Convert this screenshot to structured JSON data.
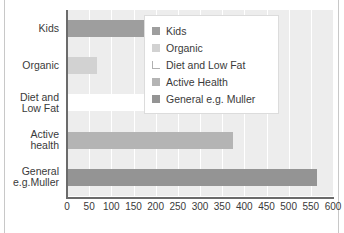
{
  "chart_data": {
    "type": "bar",
    "orientation": "horizontal",
    "title": "",
    "xlabel": "",
    "ylabel": "",
    "categories": [
      "Kids",
      "Organic",
      "Diet and Low Fat",
      "Active health",
      "General e.g.Muller"
    ],
    "category_labels_lines": [
      [
        "Kids"
      ],
      [
        "Organic"
      ],
      [
        "Diet and",
        "Low Fat"
      ],
      [
        "Active",
        "health"
      ],
      [
        "General",
        "e.g.Muller"
      ]
    ],
    "values": [
      190,
      68,
      240,
      375,
      565
    ],
    "xlim": [
      0,
      600
    ],
    "xticks": [
      0,
      50,
      100,
      150,
      200,
      250,
      300,
      350,
      400,
      450,
      500,
      550,
      600
    ],
    "xtick_labels": [
      "0",
      "50",
      "100",
      "150",
      "200",
      "250",
      "300",
      "350",
      "400",
      "450",
      "500",
      "550",
      "600"
    ],
    "grid": "vertical",
    "legend_position": "top-right",
    "series_colors": [
      "#9e9e9e",
      "#d2d2d2",
      "#ffffff",
      "#b4b4b4",
      "#949494"
    ],
    "legend": [
      {
        "label": "Kids",
        "color": "#9e9e9e"
      },
      {
        "label": "Organic",
        "color": "#d2d2d2"
      },
      {
        "label": "Diet and Low Fat",
        "color": "#ffffff"
      },
      {
        "label": "Active Health",
        "color": "#b4b4b4"
      },
      {
        "label": "General e.g. Muller",
        "color": "#949494"
      }
    ]
  }
}
